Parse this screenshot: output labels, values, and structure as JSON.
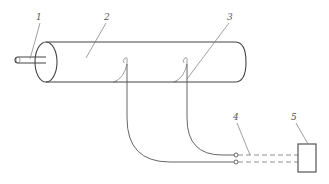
{
  "figure": {
    "type": "patent-schematic",
    "labels": [
      {
        "id": "1",
        "text": "1",
        "x": 38,
        "y": 20
      },
      {
        "id": "2",
        "text": "2",
        "x": 104,
        "y": 20
      },
      {
        "id": "3",
        "text": "3",
        "x": 228,
        "y": 20
      },
      {
        "id": "4",
        "text": "4",
        "x": 234,
        "y": 120
      },
      {
        "id": "5",
        "text": "5",
        "x": 292,
        "y": 120
      }
    ],
    "components": {
      "shaft": "1",
      "cylinder_body": "2",
      "probes": "3",
      "cable": "4",
      "instrument_box": "5"
    },
    "colors": {
      "line": "#555555",
      "background": "#ffffff"
    }
  }
}
